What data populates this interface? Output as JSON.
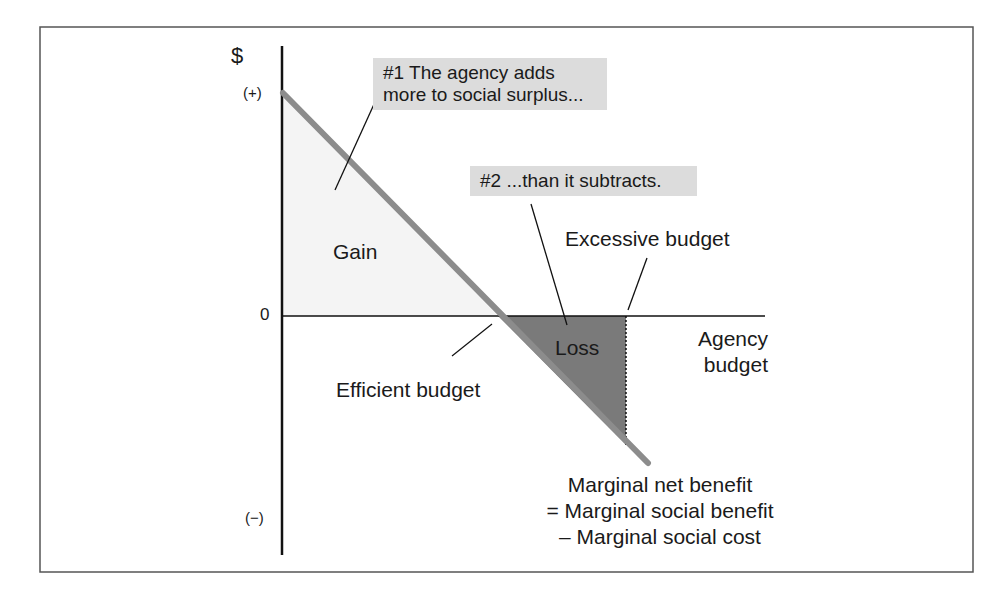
{
  "diagram": {
    "y_axis": {
      "label": "$",
      "top_tick": "(+)",
      "zero_tick": "0",
      "bottom_tick": "(−)"
    },
    "x_axis": {
      "label_line1": "Agency",
      "label_line2": "budget"
    },
    "regions": {
      "gain": "Gain",
      "loss": "Loss"
    },
    "callouts": {
      "first_line1": "#1 The agency adds",
      "first_line2": "more to social surplus...",
      "second": "#2 ...than it subtracts."
    },
    "annotations": {
      "efficient": "Efficient budget",
      "excessive": "Excessive budget"
    },
    "curve_label": {
      "line1": "Marginal net benefit",
      "line2": "= Marginal social benefit",
      "line3": "– Marginal social cost"
    },
    "colors": {
      "frame": "#555555",
      "axis": "#111111",
      "curve": "#8c8c8c",
      "gain_fill": "#f4f4f4",
      "loss_fill": "#7a7a7a",
      "callout_bg": "#dcdcdc"
    }
  }
}
